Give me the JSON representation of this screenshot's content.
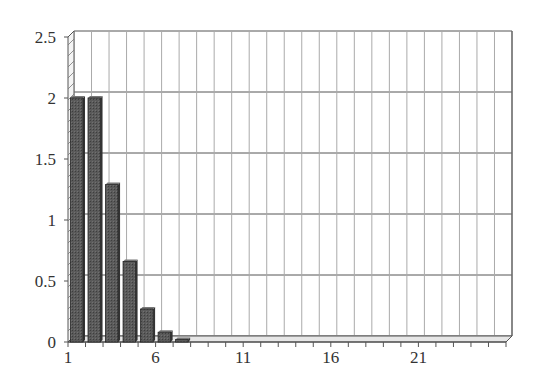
{
  "chart_data": {
    "type": "bar",
    "title": "",
    "xlabel": "",
    "ylabel": "",
    "categories": [
      1,
      2,
      3,
      4,
      5,
      6,
      7,
      8,
      9,
      10,
      11,
      12,
      13,
      14,
      15,
      16,
      17,
      18,
      19,
      20,
      21,
      22,
      23,
      24,
      25
    ],
    "values": [
      2.0,
      2.0,
      1.29,
      0.66,
      0.27,
      0.08,
      0.02,
      0,
      0,
      0,
      0,
      0,
      0,
      0,
      0,
      0,
      0,
      0,
      0,
      0,
      0,
      0,
      0,
      0,
      0
    ],
    "ylim": [
      0,
      2.5
    ],
    "yticks": [
      "0",
      "0.5",
      "1",
      "1.5",
      "2",
      "2.5"
    ],
    "xtick_labels": [
      "1",
      "6",
      "11",
      "16",
      "21"
    ],
    "grid": true,
    "legend": null,
    "style": "3d-bar",
    "bar_color": "#555555",
    "grid_color": "#999999"
  }
}
